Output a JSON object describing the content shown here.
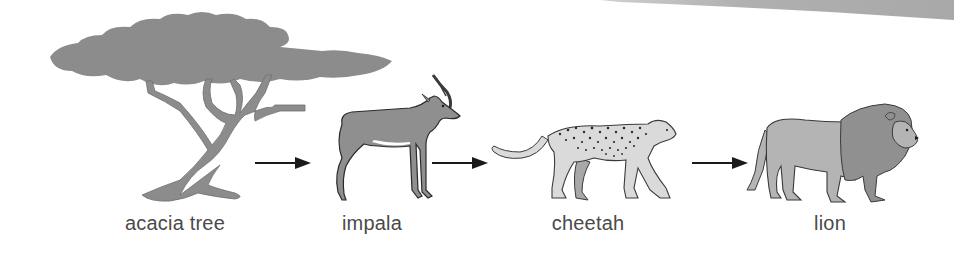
{
  "diagram": {
    "type": "food-chain",
    "colors": {
      "tree": "#8c8c8c",
      "impala": "#8f8f8f",
      "cheetah": "#dadada",
      "cheetah_spots": "#333333",
      "lion_body": "#b4b4b4",
      "lion_mane": "#909090",
      "arrow": "#1a1a1a",
      "label": "#4a4a4a",
      "band": "#b8b8b8"
    },
    "organisms": [
      {
        "id": "acacia-tree",
        "label": "acacia tree",
        "role": "producer"
      },
      {
        "id": "impala",
        "label": "impala",
        "role": "primary consumer"
      },
      {
        "id": "cheetah",
        "label": "cheetah",
        "role": "secondary consumer"
      },
      {
        "id": "lion",
        "label": "lion",
        "role": "tertiary consumer"
      }
    ],
    "arrows": [
      {
        "from": "acacia tree",
        "to": "impala"
      },
      {
        "from": "impala",
        "to": "cheetah"
      },
      {
        "from": "cheetah",
        "to": "lion"
      }
    ]
  }
}
